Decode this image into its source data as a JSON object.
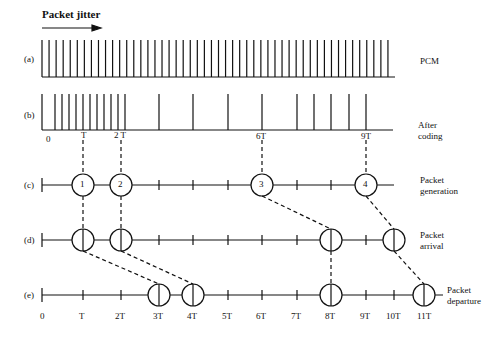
{
  "title": "Packet jitter",
  "rows": [
    {
      "id": "a",
      "tag": "(a)",
      "label": "PCM"
    },
    {
      "id": "b",
      "tag": "(b)",
      "label_line1": "After",
      "label_line2": "coding"
    },
    {
      "id": "c",
      "tag": "(c)",
      "label_line1": "Packet",
      "label_line2": "generation"
    },
    {
      "id": "d",
      "tag": "(d)",
      "label_line1": "Packet",
      "label_line2": "arrival"
    },
    {
      "id": "e",
      "tag": "(e)",
      "label_line1": "Packet",
      "label_line2": "departure"
    }
  ],
  "row_b_ticks": [
    "0",
    "T",
    "2 T",
    "6T",
    "9T"
  ],
  "packets": [
    "1",
    "2",
    "3",
    "4"
  ],
  "time_axis": [
    "0",
    "T",
    "2T",
    "3T",
    "4T",
    "5T",
    "6T",
    "7T",
    "8T",
    "9T",
    "10T",
    "11T"
  ],
  "colors": {
    "ink": "#111111",
    "background": "#ffffff"
  }
}
